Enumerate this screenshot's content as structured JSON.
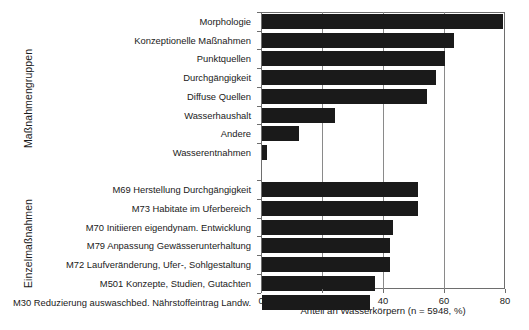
{
  "chart_data": {
    "type": "bar",
    "orientation": "horizontal",
    "title": "",
    "xlabel": "Anteil an Wasserkörpern (n = 5948, %)",
    "ylabel": "",
    "xlim": [
      0,
      80
    ],
    "xticks": [
      0,
      20,
      40,
      60,
      80
    ],
    "xticklabels": [
      "0",
      "20",
      "40",
      "60",
      "80"
    ],
    "grid": "vertical gridlines at 20, 40, 60",
    "legend": "none",
    "bar_color": "#1a1a1a",
    "groups": [
      {
        "name": "Maßnahmengruppen",
        "axis_title": "Maßnahmengruppen",
        "categories": [
          "Morphologie",
          "Konzeptionelle Maßnahmen",
          "Punktquellen",
          "Durchgängigkeit",
          "Diffuse Quellen",
          "Wasserhaushalt",
          "Andere",
          "Wasserentnahmen"
        ],
        "values": [
          79,
          63,
          60,
          57,
          54,
          24,
          12,
          1.5
        ]
      },
      {
        "name": "Einzelmaßnahmen",
        "axis_title": "Einzelmaßnahmen",
        "categories": [
          "M69 Herstellung Durchgängigkeit",
          "M73 Habitate im Uferbereich",
          "M70 Initiieren eigendynam. Entwicklung",
          "M79 Anpassung Gewässerunterhaltung",
          "M72 Laufveränderung, Ufer-, Sohlgestaltung",
          "M501 Konzepte, Studien, Gutachten",
          "M30 Reduzierung auswaschbed. Nährstoffeintrag Landw."
        ],
        "values": [
          51,
          51,
          43,
          42,
          42,
          37,
          35.5
        ]
      }
    ]
  }
}
